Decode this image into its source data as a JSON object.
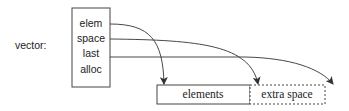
{
  "diagram": {
    "label": "vector:",
    "fields": [
      "elem",
      "space",
      "last",
      "alloc"
    ],
    "memory": {
      "used_label": "elements",
      "extra_label": "extra space"
    },
    "pointers": [
      {
        "from": "elem",
        "to": "start of elements"
      },
      {
        "from": "space",
        "to": "end of elements / start of extra space"
      },
      {
        "from": "last",
        "to": "end of extra space"
      }
    ],
    "colors": {
      "stroke": "#333333",
      "text": "#222222"
    }
  }
}
